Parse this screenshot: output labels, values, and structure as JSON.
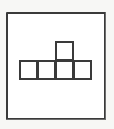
{
  "figure": {
    "background_color": "#f7f7f5",
    "line_color": "#3a3a3a",
    "fill_color": "#ffffff"
  },
  "frame": {
    "name": "outer-frame",
    "shape": "square",
    "stroke_color": "#3a3a3a",
    "fill_color": "#ffffff",
    "stroke_width_px": 2
  },
  "polyomino": {
    "name": "polyomino",
    "cell_count": 5,
    "stroke_color": "#3a3a3a",
    "fill_color": "#ffffff",
    "cells": [
      {
        "id": "r0c0",
        "row": 0,
        "col": 0,
        "label": ""
      },
      {
        "id": "r0c1",
        "row": 0,
        "col": 1,
        "label": ""
      },
      {
        "id": "r0c2",
        "row": 0,
        "col": 2,
        "label": ""
      },
      {
        "id": "r0c3",
        "row": 0,
        "col": 3,
        "label": ""
      },
      {
        "id": "r1c2",
        "row": 1,
        "col": 2,
        "label": ""
      }
    ]
  }
}
